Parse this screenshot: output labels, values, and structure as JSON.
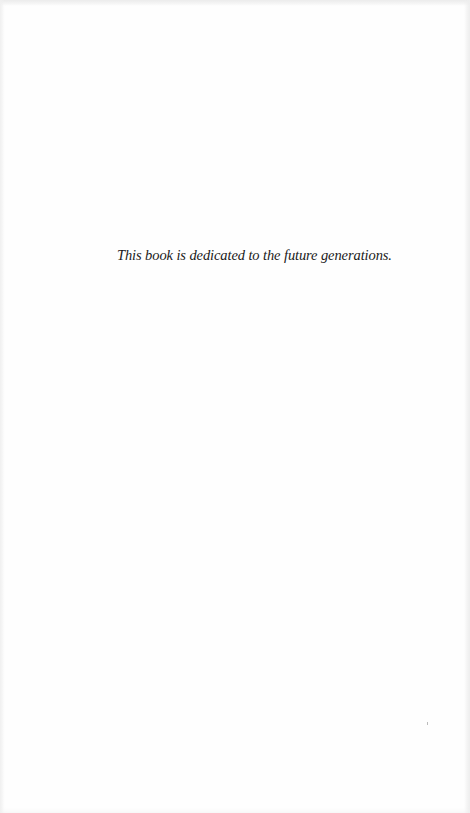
{
  "page": {
    "dedication_text": "This book is dedicated to the future generations.",
    "background_color": "#fefefe",
    "text_color": "#1a1a1a"
  }
}
